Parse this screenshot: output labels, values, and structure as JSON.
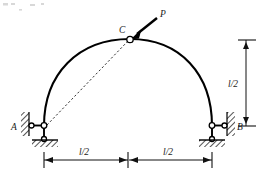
{
  "figure": {
    "type": "structural-engineering-diagram",
    "canvas": {
      "width": 266,
      "height": 180,
      "background": "#ffffff"
    },
    "stroke_color": "#000000",
    "text_color": "#1a1a1a"
  },
  "labels": {
    "support_left": "A",
    "support_right": "B",
    "crown_hinge": "C",
    "force": "P",
    "dim_vertical": "l/2",
    "dim_span_left": "l/2",
    "dim_span_right": "l/2"
  },
  "geometry": {
    "span_total": "l",
    "rise": "l/2",
    "left_support": {
      "x": 44,
      "y": 126
    },
    "right_support": {
      "x": 212,
      "y": 126
    },
    "crown": {
      "x": 130,
      "y": 39
    },
    "curve_type": "parabolic-arch",
    "chord_from": "A",
    "chord_to": "C"
  },
  "force": {
    "name": "P",
    "applied_at": "C",
    "direction": "down-left",
    "tail": {
      "x": 158,
      "y": 17
    },
    "head": {
      "x": 133,
      "y": 37
    }
  },
  "icons": {
    "hinge": "hinge-circle-icon",
    "pin_support": "pin-support-icon",
    "roller_link": "link-bar-icon",
    "hatching": "ground-hatch-icon",
    "arrowhead": "arrowhead-icon"
  },
  "dimensions": {
    "vertical": {
      "label": "l/2",
      "top_y": 40,
      "bottom_y": 126,
      "x": 246
    },
    "horizontal": {
      "label_left": "l/2",
      "label_right": "l/2",
      "y": 160,
      "left_x": 44,
      "mid_x": 128,
      "right_x": 212
    }
  }
}
